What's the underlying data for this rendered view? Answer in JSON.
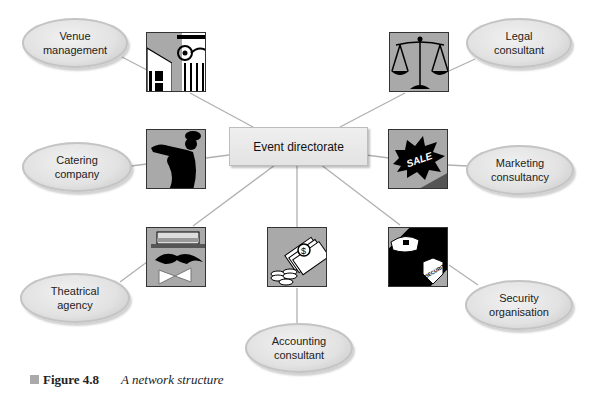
{
  "figure": {
    "number_label": "Figure 4.8",
    "title": "A network structure"
  },
  "center": {
    "label": "Event directorate"
  },
  "nodes": [
    {
      "id": "venue",
      "label": "Venue\nmanagement",
      "icon": "classical-building-icon"
    },
    {
      "id": "catering",
      "label": "Catering\ncompany",
      "icon": "waiter-silhouette-icon"
    },
    {
      "id": "theatrical",
      "label": "Theatrical\nagency",
      "icon": "hat-moustache-bowtie-icon"
    },
    {
      "id": "accounting",
      "label": "Accounting\nconsultant",
      "icon": "money-coins-icon"
    },
    {
      "id": "security",
      "label": "Security\norganisation",
      "icon": "police-badge-icon"
    },
    {
      "id": "marketing",
      "label": "Marketing\nconsultancy",
      "icon": "sale-burst-icon"
    },
    {
      "id": "legal",
      "label": "Legal\nconsultant",
      "icon": "scales-of-justice-icon"
    }
  ],
  "icon_texts": {
    "sale": "SALE",
    "security": "SECURITY",
    "dollar": "$"
  },
  "colors": {
    "line": "#b0b0b0",
    "icon_bg": "#a9a9a9",
    "ellipse": "#e2e2e2"
  }
}
